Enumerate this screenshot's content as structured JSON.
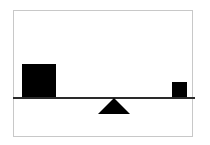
{
  "diagram": {
    "type": "balance-scale",
    "colors": {
      "frame_border": "#c8c8c8",
      "beam": "#2a2a2a",
      "weights": "#000000",
      "fulcrum": "#000000",
      "background": "#ffffff"
    },
    "elements": {
      "left_weight": {
        "shape": "square",
        "size": "large"
      },
      "right_weight": {
        "shape": "square",
        "size": "small"
      },
      "fulcrum": {
        "shape": "triangle",
        "position": "center-left"
      },
      "beam": {
        "orientation": "horizontal"
      }
    }
  }
}
